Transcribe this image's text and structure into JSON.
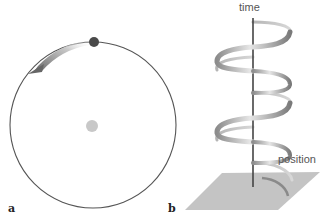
{
  "panel_a": {
    "label": "a",
    "circle": {
      "cx": 93,
      "cy": 125,
      "r": 83,
      "stroke": "#555555"
    },
    "center_dot": {
      "cx": 92,
      "cy": 126,
      "r": 6,
      "fill": "#c8c8c8"
    },
    "moving_dot": {
      "cx": 94,
      "cy": 42,
      "r": 5,
      "fill": "#4a4a4a"
    },
    "arrow": {
      "direction": "counterclockwise",
      "color": "#6e6e6e"
    }
  },
  "panel_b": {
    "label": "b",
    "time_label": "time",
    "position_label": "position",
    "plane_fill": "#c4c4c4",
    "axis_color": "#444444",
    "helix_color": "#9a9a9a"
  }
}
